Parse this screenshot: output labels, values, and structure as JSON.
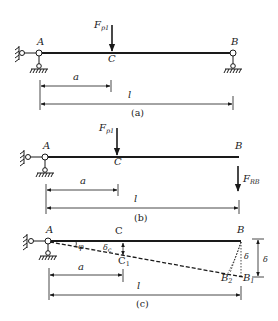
{
  "diagram_a": {
    "label_A": "A",
    "label_B": "B",
    "label_C": "C",
    "force": "F",
    "force_sub": "p1",
    "dim_a": "a",
    "dim_l": "l",
    "caption": "(a)"
  },
  "diagram_b": {
    "label_A": "A",
    "label_B": "B",
    "label_C": "C",
    "force": "F",
    "force_sub": "p1",
    "reaction": "F",
    "reaction_sub": "RB",
    "dim_a": "a",
    "dim_l": "l",
    "caption": "(b)"
  },
  "diagram_c": {
    "label_A": "A",
    "label_B": "B",
    "label_C": "C",
    "label_C1": "C",
    "label_C1_sub": "1",
    "label_B1": "B",
    "label_B1_sub": "1",
    "label_B2": "B",
    "label_B2_sub": "2",
    "angle": "φ",
    "delta_c": "δ",
    "delta_c_sub": "c",
    "delta": "δ",
    "dim_a": "a",
    "dim_l": "l",
    "caption": "(c)"
  },
  "colors": {
    "line": "#1a1a1a",
    "background": "#ffffff"
  }
}
